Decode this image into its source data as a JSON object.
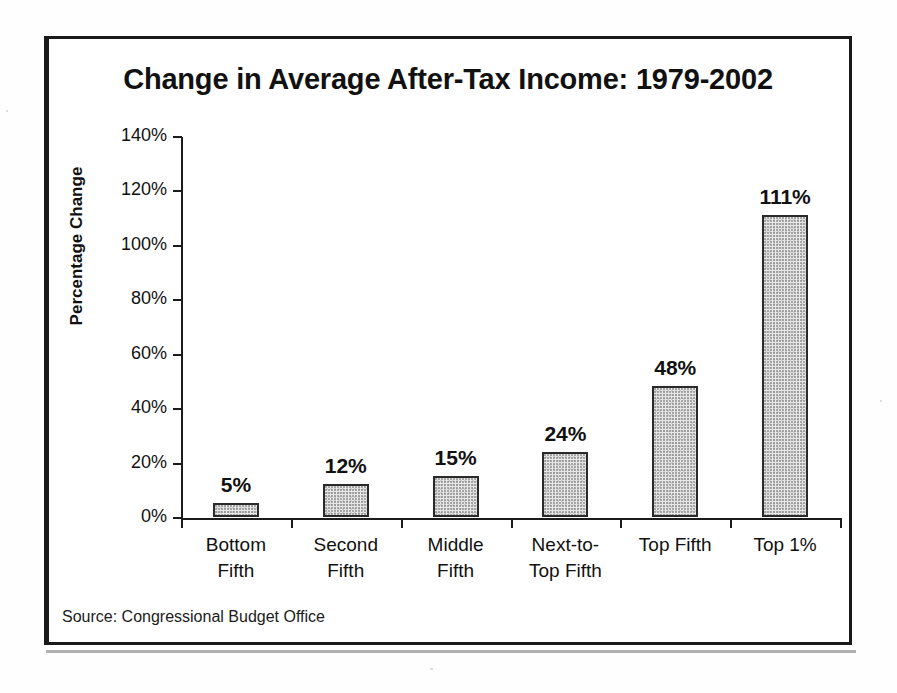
{
  "chart_data": {
    "type": "bar",
    "title": "Change in Average After-Tax Income: 1979-2002",
    "xlabel": "",
    "ylabel": "Percentage Change",
    "categories": [
      "Bottom Fifth",
      "Second Fifth",
      "Middle Fifth",
      "Next-to-Top Fifth",
      "Top Fifth",
      "Top 1%"
    ],
    "category_lines": [
      [
        "Bottom",
        "Fifth"
      ],
      [
        "Second",
        "Fifth"
      ],
      [
        "Middle",
        "Fifth"
      ],
      [
        "Next-to-",
        "Top Fifth"
      ],
      [
        "Top Fifth",
        ""
      ],
      [
        "Top 1%",
        ""
      ]
    ],
    "values": [
      5,
      12,
      15,
      24,
      48,
      111
    ],
    "value_labels": [
      "5%",
      "12%",
      "15%",
      "24%",
      "48%",
      "111%"
    ],
    "ylim": [
      0,
      140
    ],
    "ytick_values": [
      0,
      20,
      40,
      60,
      80,
      100,
      120,
      140
    ],
    "ytick_labels": [
      "0%",
      "20%",
      "40%",
      "60%",
      "80%",
      "100%",
      "120%",
      "140%"
    ],
    "grid": false,
    "legend": false,
    "units": "percent",
    "bar_fill_color": "#e8e8e8",
    "bar_border_color": "#2a2a2a",
    "axis_color": "#1b1b1b",
    "text_color": "#111111"
  },
  "source": {
    "note": "Source: Congressional Budget Office"
  }
}
